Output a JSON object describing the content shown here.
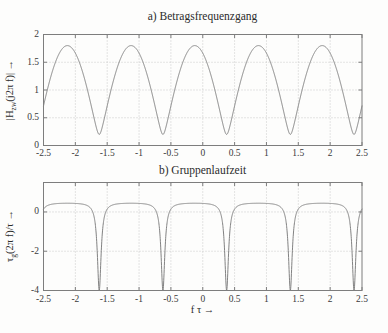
{
  "figure": {
    "bg_color": "#fdfdfc",
    "axis_color": "#7d7d7d",
    "grid_color": "#c9c9c9",
    "curve_color": "#828282",
    "text_color": "#2b2b2b"
  },
  "chart_data": [
    {
      "id": "magnitude",
      "type": "line",
      "title": "a) Betragsfrequenzgang",
      "xlabel": "",
      "ylabel": "|H_zw(j2π f)| →",
      "ylabel_parts": {
        "pre": "|H",
        "sub": "zw",
        "post": "(j2π f)| →"
      },
      "xlim": [
        -2.5,
        2.5
      ],
      "ylim": [
        0,
        2
      ],
      "xticks": [
        -2.5,
        -2,
        -1.5,
        -1,
        -0.5,
        0,
        0.5,
        1,
        1.5,
        2,
        2.5
      ],
      "xtick_labels": [
        "-2.5",
        "-2",
        "-1.5",
        "-1",
        "-0.5",
        "0",
        "0.5",
        "1",
        "1.5",
        "2",
        "2.5"
      ],
      "yticks": [
        0,
        0.5,
        1,
        1.5,
        2
      ],
      "ytick_labels": [
        "0",
        "0.5",
        "1",
        "1.5",
        "2"
      ],
      "grid": true,
      "curve": {
        "name": "|H_zw(j2π f)|",
        "model": "sqrt(1 + a^2 + 2*a*cos(2*pi*f_tau + phase_rad))",
        "a": 0.8,
        "phase_rad": 0.7853981634,
        "period_ftau": 1,
        "max_value": 1.8,
        "min_value": 0.2,
        "max_positions_ftau": [
          -2.125,
          -1.125,
          -0.125,
          0.875,
          1.875
        ],
        "min_positions_ftau": [
          -1.625,
          -0.625,
          0.375,
          1.375,
          2.375
        ]
      }
    },
    {
      "id": "group_delay",
      "type": "line",
      "title": "b) Gruppenlaufzeit",
      "xlabel": "f τ →",
      "ylabel": "τ_g(2π f)/τ →",
      "ylabel_parts": {
        "pre": "τ",
        "sub": "g",
        "post": "(2π f)/τ →"
      },
      "xlim": [
        -2.5,
        2.5
      ],
      "ylim": [
        -4,
        1.5
      ],
      "xticks": [
        -2.5,
        -2,
        -1.5,
        -1,
        -0.5,
        0,
        0.5,
        1,
        1.5,
        2,
        2.5
      ],
      "xtick_labels": [
        "-2.5",
        "-2",
        "-1.5",
        "-1",
        "-0.5",
        "0",
        "0.5",
        "1",
        "1.5",
        "2",
        "2.5"
      ],
      "yticks": [
        -4,
        -2,
        0
      ],
      "ytick_labels": [
        "-4",
        "-2",
        "0"
      ],
      "grid": true,
      "curve": {
        "name": "τ_g(2π f)/τ",
        "model": "a*(a + cos(2*pi*f_tau + phase_rad)) / (1 + a^2 + 2*a*cos(2*pi*f_tau + phase_rad))",
        "a": 0.8,
        "phase_rad": 0.7853981634,
        "period_ftau": 1,
        "plateau_value": 0.444,
        "dip_value": -4,
        "dip_positions_ftau": [
          -1.625,
          -0.625,
          0.375,
          1.375,
          2.375
        ]
      }
    }
  ]
}
